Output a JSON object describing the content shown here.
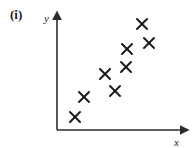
{
  "figure": {
    "part_label": "(i)",
    "stroke_color": "#2b2b2b",
    "marker_color": "#1a1a1a",
    "background_color": "#ffffff"
  },
  "chart_data": {
    "type": "scatter",
    "title": "",
    "xlabel": "x",
    "ylabel": "y",
    "grid": false,
    "legend": null,
    "axis_arrows": true,
    "tick_labels": {
      "x": [],
      "y": []
    },
    "xlim": [
      0,
      10
    ],
    "ylim": [
      0,
      10
    ],
    "marker": "x",
    "n_points": 8,
    "correlation": "strong positive",
    "points": [
      {
        "x": 1.5,
        "y": 1.2
      },
      {
        "x": 2.2,
        "y": 2.9
      },
      {
        "x": 3.9,
        "y": 4.9
      },
      {
        "x": 4.7,
        "y": 3.4
      },
      {
        "x": 5.6,
        "y": 6.0
      },
      {
        "x": 5.7,
        "y": 7.1
      },
      {
        "x": 7.0,
        "y": 9.3
      },
      {
        "x": 7.6,
        "y": 7.6
      }
    ],
    "points_px": [
      {
        "cx": 75,
        "cy": 117
      },
      {
        "cx": 84,
        "cy": 97
      },
      {
        "cx": 105,
        "cy": 74
      },
      {
        "cx": 115,
        "cy": 91
      },
      {
        "cx": 126,
        "cy": 67
      },
      {
        "cx": 127,
        "cy": 49
      },
      {
        "cx": 142,
        "cy": 24
      },
      {
        "cx": 149,
        "cy": 43
      }
    ],
    "axes_px": {
      "origin_x": 57,
      "origin_y": 130,
      "y_top": 16,
      "x_right": 185
    },
    "label_positions_px": {
      "x_label": {
        "x": 176,
        "y": 145
      },
      "y_label": {
        "x": 44,
        "y": 22
      }
    }
  }
}
